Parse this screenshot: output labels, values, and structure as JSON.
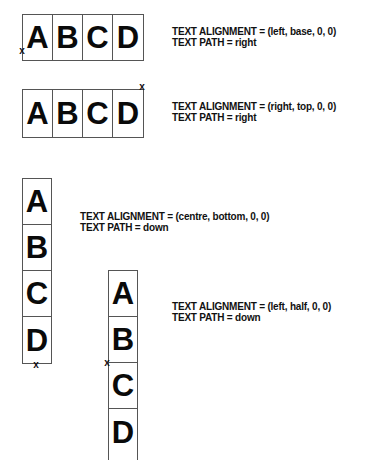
{
  "examples": [
    {
      "letters": [
        "A",
        "B",
        "C",
        "D"
      ],
      "path": "right",
      "alignment_line": "TEXT ALIGNMENT = (left, base, 0, 0)",
      "path_line": "TEXT PATH = right",
      "marker": "x"
    },
    {
      "letters": [
        "A",
        "B",
        "C",
        "D"
      ],
      "path": "right",
      "alignment_line": "TEXT ALIGNMENT = (right, top, 0, 0)",
      "path_line": "TEXT PATH = right",
      "marker": "x"
    },
    {
      "letters": [
        "A",
        "B",
        "C",
        "D"
      ],
      "path": "down",
      "alignment_line": "TEXT ALIGNMENT = (centre, bottom, 0, 0)",
      "path_line": "TEXT PATH = down",
      "marker": "x"
    },
    {
      "letters": [
        "A",
        "B",
        "C",
        "D"
      ],
      "path": "down",
      "alignment_line": "TEXT ALIGNMENT = (left, half, 0, 0)",
      "path_line": "TEXT PATH = down",
      "marker": "x"
    }
  ]
}
